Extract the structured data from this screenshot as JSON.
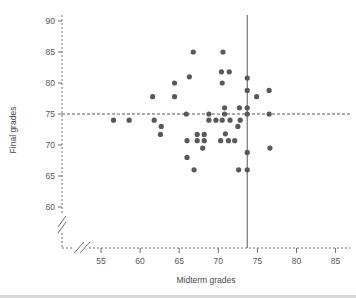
{
  "chart_data": {
    "type": "scatter",
    "title": "",
    "xlabel": "Midterm grades",
    "ylabel": "Final grades",
    "xlim": [
      52,
      86
    ],
    "ylim": [
      57.5,
      91
    ],
    "xticks": [
      55,
      60,
      65,
      70,
      75,
      80,
      85
    ],
    "yticks": [
      60,
      65,
      70,
      75,
      80,
      85,
      90
    ],
    "grid": false,
    "legend": null,
    "axis_break": true,
    "axis_style": "dashed",
    "point_color": "#58595b",
    "reference_lines": [
      {
        "name": "mean-final-grade-line",
        "orientation": "horizontal",
        "value": 75,
        "style": "dashed",
        "color": "#58595b"
      },
      {
        "name": "mean-midterm-grade-line",
        "orientation": "vertical",
        "value": 73.7,
        "style": "solid",
        "color": "#58595b"
      }
    ],
    "points": [
      [
        56.6,
        74.0
      ],
      [
        58.6,
        74.0
      ],
      [
        61.8,
        74.0
      ],
      [
        61.6,
        77.8
      ],
      [
        62.7,
        73.0
      ],
      [
        62.6,
        71.7
      ],
      [
        64.4,
        80.0
      ],
      [
        64.4,
        77.8
      ],
      [
        65.9,
        75.0
      ],
      [
        66.0,
        70.7
      ],
      [
        66.3,
        81.0
      ],
      [
        66.0,
        68.0
      ],
      [
        66.8,
        85.0
      ],
      [
        66.9,
        66.0
      ],
      [
        67.3,
        71.7
      ],
      [
        67.3,
        70.7
      ],
      [
        68.2,
        71.7
      ],
      [
        68.2,
        70.7
      ],
      [
        68.0,
        69.5
      ],
      [
        68.8,
        75.0
      ],
      [
        68.8,
        74.0
      ],
      [
        69.7,
        74.0
      ],
      [
        70.5,
        74.0
      ],
      [
        70.6,
        85.0
      ],
      [
        70.4,
        81.8
      ],
      [
        71.4,
        81.8
      ],
      [
        70.5,
        80.0
      ],
      [
        70.8,
        76.0
      ],
      [
        70.8,
        75.0
      ],
      [
        71.5,
        74.0
      ],
      [
        70.9,
        71.8
      ],
      [
        70.3,
        70.7
      ],
      [
        71.3,
        70.7
      ],
      [
        72.1,
        70.7
      ],
      [
        72.8,
        74.0
      ],
      [
        72.5,
        73.0
      ],
      [
        72.7,
        76.0
      ],
      [
        72.6,
        66.0
      ],
      [
        73.7,
        76.0
      ],
      [
        73.7,
        78.8
      ],
      [
        73.7,
        80.8
      ],
      [
        73.7,
        75.0
      ],
      [
        73.7,
        68.8
      ],
      [
        73.7,
        66.0
      ],
      [
        74.9,
        77.8
      ],
      [
        76.5,
        78.8
      ],
      [
        76.5,
        75.0
      ],
      [
        76.6,
        69.5
      ]
    ]
  }
}
